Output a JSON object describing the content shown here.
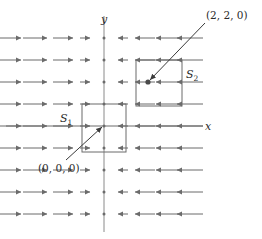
{
  "figure": {
    "background_color": "#ffffff",
    "stroke_color": "#6b6b6b",
    "text_color": "#2b2b2b",
    "axis": {
      "x_label": "x",
      "y_label": "y",
      "origin_px": [
        104,
        126
      ]
    },
    "labels": {
      "surface_1": "S",
      "surface_1_sub": "1",
      "surface_2": "S",
      "surface_2_sub": "2",
      "point_origin": "(0, 0, 0)",
      "point_two_two_zero": "(2, 2, 0)"
    },
    "surfaces": [
      {
        "name": "S1",
        "x": 82,
        "y": 104,
        "w": 44,
        "h": 48
      },
      {
        "name": "S2",
        "x": 136,
        "y": 60,
        "w": 46,
        "h": 46
      }
    ],
    "marked_points": [
      {
        "label": "(0, 0, 0)",
        "x": 104,
        "y": 126
      },
      {
        "label": "(2, 2, 0)",
        "x": 148,
        "y": 82
      }
    ]
  },
  "chart_data": {
    "type": "scatter",
    "xlabel": "x",
    "ylabel": "y",
    "grid": false,
    "legend": null,
    "columns_px": [
      21,
      47,
      73,
      90,
      104,
      118,
      135,
      156,
      177
    ],
    "rows_px": [
      38,
      60,
      82,
      104,
      126,
      148,
      170,
      192,
      214
    ],
    "arrow_lengths_px": [
      26,
      24,
      20,
      10,
      3,
      10,
      20,
      24,
      26
    ],
    "arrow_directions": [
      "right",
      "right",
      "right",
      "right",
      "none",
      "left",
      "left",
      "left",
      "left"
    ]
  }
}
